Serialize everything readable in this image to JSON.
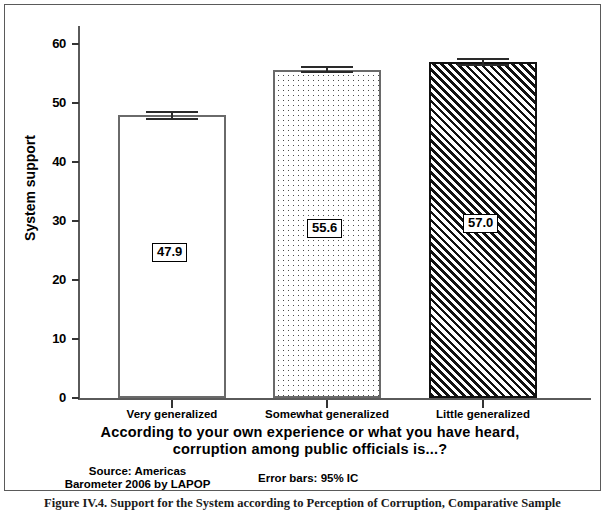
{
  "chart_data": {
    "type": "bar",
    "title": "",
    "categories": [
      "Very generalized",
      "Somewhat generalized",
      "Little generalized"
    ],
    "values": [
      47.9,
      55.6,
      57.0
    ],
    "value_labels": [
      "47.9",
      "55.6",
      "57.0"
    ],
    "series": [
      {
        "name": "System support",
        "values": [
          47.9,
          55.6,
          57.0
        ]
      }
    ],
    "errors": [
      {
        "category": "Very generalized",
        "value": 47.9,
        "low": 47.2,
        "high": 48.6
      },
      {
        "category": "Somewhat generalized",
        "value": 55.6,
        "low": 55.0,
        "high": 56.2
      },
      {
        "category": "Little generalized",
        "value": 57.0,
        "low": 56.3,
        "high": 57.7
      }
    ],
    "bar_patterns": [
      "plain",
      "dotted",
      "hatch"
    ],
    "xlabel": "According to your own experience or what you have heard, corruption among public officials is...?",
    "ylabel": "System support",
    "ylim": [
      0,
      60
    ],
    "yticks": [
      0,
      10,
      20,
      30,
      40,
      50,
      60
    ],
    "ytick_labels": [
      "0",
      "10",
      "20",
      "30",
      "40",
      "50",
      "60"
    ],
    "grid": false,
    "legend": "none",
    "error_bar_note": "Error bars: 95% IC",
    "source": "Source: Americas Barometer 2006 by LAPOP"
  },
  "axis": {
    "y_title": "System support",
    "y_ticks": [
      {
        "label": "60",
        "value": 60
      },
      {
        "label": "50",
        "value": 50
      },
      {
        "label": "40",
        "value": 40
      },
      {
        "label": "30",
        "value": 30
      },
      {
        "label": "20",
        "value": 20
      },
      {
        "label": "10",
        "value": 10
      },
      {
        "label": "0",
        "value": 0
      }
    ],
    "x_categories": [
      {
        "label": "Very generalized"
      },
      {
        "label": "Somewhat generalized"
      },
      {
        "label": "Little generalized"
      }
    ]
  },
  "captions": {
    "x_axis_title_line1": "According to your own experience or what you have heard,",
    "x_axis_title_line2": "corruption among public officials is...?",
    "source_line1": "Source: Americas",
    "source_line2": "Barometer 2006 by LAPOP",
    "error_bars": "Error bars: 95% IC",
    "figure_caption": "Figure IV.4. Support for the System according to Perception of Corruption, Comparative Sample"
  },
  "colors": {
    "axis": "#5a5a5a",
    "bar_outline": "#6a6a6a",
    "hatch": "#111111",
    "text": "#000000",
    "background": "#ffffff"
  }
}
